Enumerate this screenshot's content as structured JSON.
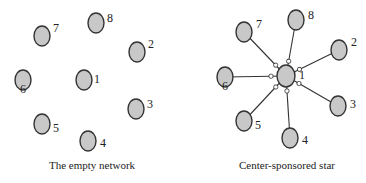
{
  "panels": [
    {
      "caption": "The empty network",
      "center": "1",
      "nodes": [
        {
          "id": "1",
          "label": "1"
        },
        {
          "id": "2",
          "label": "2"
        },
        {
          "id": "3",
          "label": "3"
        },
        {
          "id": "4",
          "label": "4"
        },
        {
          "id": "5",
          "label": "5"
        },
        {
          "id": "6",
          "label": "6"
        },
        {
          "id": "7",
          "label": "7"
        },
        {
          "id": "8",
          "label": "8"
        }
      ],
      "edges": []
    },
    {
      "caption": "Center-sponsored star",
      "center": "1",
      "nodes": [
        {
          "id": "1",
          "label": "1"
        },
        {
          "id": "2",
          "label": "2"
        },
        {
          "id": "3",
          "label": "3"
        },
        {
          "id": "4",
          "label": "4"
        },
        {
          "id": "5",
          "label": "5"
        },
        {
          "id": "6",
          "label": "6"
        },
        {
          "id": "7",
          "label": "7"
        },
        {
          "id": "8",
          "label": "8"
        }
      ],
      "edges": [
        {
          "from": "1",
          "to": "2",
          "sponsor": "1"
        },
        {
          "from": "1",
          "to": "3",
          "sponsor": "1"
        },
        {
          "from": "1",
          "to": "4",
          "sponsor": "1"
        },
        {
          "from": "1",
          "to": "5",
          "sponsor": "1"
        },
        {
          "from": "1",
          "to": "6",
          "sponsor": "1"
        },
        {
          "from": "1",
          "to": "7",
          "sponsor": "1"
        },
        {
          "from": "1",
          "to": "8",
          "sponsor": "1"
        }
      ]
    }
  ]
}
